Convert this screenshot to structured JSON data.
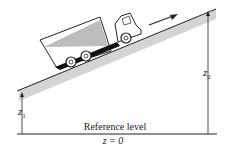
{
  "diagram": {
    "labels": {
      "z1": "z",
      "z1_sub": "1",
      "z2": "z",
      "z2_sub": "2",
      "reference": "Reference level",
      "zero": "z = 0"
    },
    "objects": [
      "truck",
      "incline",
      "motion-arrow",
      "reference-line",
      "height-arrows"
    ]
  }
}
